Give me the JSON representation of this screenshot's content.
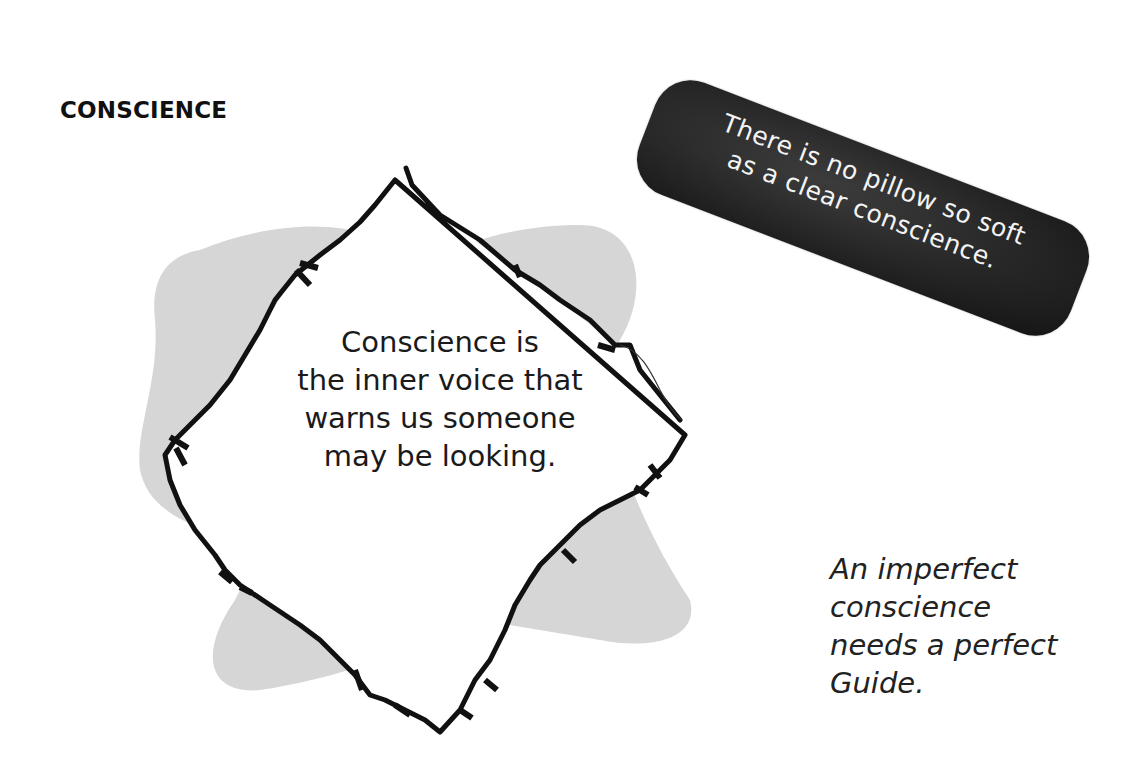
{
  "page": {
    "title": "CONSCIENCE"
  },
  "center_quote": {
    "lines": [
      "Conscience is",
      "the inner voice that",
      "warns us someone",
      "may be looking."
    ]
  },
  "banner_quote": {
    "lines": [
      "There is no pillow so soft",
      "as a clear conscience."
    ]
  },
  "side_quote": {
    "lines": [
      "An imperfect",
      "conscience",
      "needs a perfect",
      "Guide."
    ]
  },
  "colors": {
    "background": "#ffffff",
    "blob_gray": "#d6d6d6",
    "frame_stroke": "#111111",
    "banner_fill": "#2a2a2a",
    "banner_text": "#f4f4f4",
    "body_text": "#1a1a1a"
  }
}
